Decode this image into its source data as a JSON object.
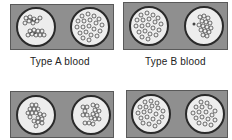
{
  "panels": [
    {
      "id": "top-left",
      "blood_type": "A",
      "label": "Type A blood",
      "left_dish": "clumped",
      "right_dish": "dispersed"
    },
    {
      "id": "top-right",
      "blood_type": "B",
      "label": "Type B blood",
      "left_dish": "dispersed",
      "right_dish": "clumped"
    },
    {
      "id": "bottom-left",
      "blood_type": "AB",
      "label": "",
      "left_dish": "clumped",
      "right_dish": "clumped"
    },
    {
      "id": "bottom-right",
      "blood_type": "O",
      "label": "",
      "left_dish": "dispersed",
      "right_dish": "dispersed"
    }
  ],
  "labels": {
    "type_a": "Type A blood",
    "type_b": "Type B blood"
  },
  "colors": {
    "panel_bg": "#8f8f8f",
    "dish_bg": "#ededed",
    "dish_border": "#2a2a2a",
    "cell_stroke": "#333333"
  }
}
